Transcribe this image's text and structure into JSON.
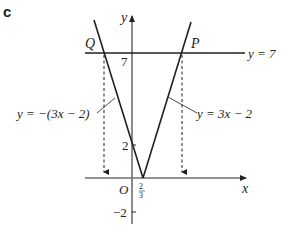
{
  "part_label": "c",
  "axes": {
    "x_label": "x",
    "y_label": "y",
    "origin_label": "O"
  },
  "ticks": {
    "y_7": "7",
    "y_2": "2",
    "y_neg2": "−2",
    "x_frac_num": "2",
    "x_frac_den": "3"
  },
  "points": {
    "Q": "Q",
    "P": "P"
  },
  "lines": {
    "horizontal": {
      "label": "y = 7"
    },
    "left_branch": {
      "label": "y = −(3x − 2)"
    },
    "right_branch": {
      "label": "y = 3x − 2"
    }
  },
  "colors": {
    "ink": "#231f20",
    "axis": "#6d6e71"
  }
}
